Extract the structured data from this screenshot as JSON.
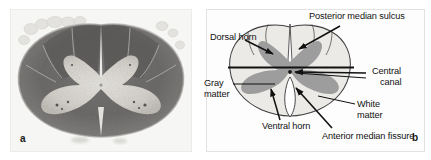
{
  "figure": {
    "type": "two-panel anatomical figure"
  },
  "panel_a": {
    "letter": "a",
    "kind": "histological-micrograph",
    "description": "Myelin-stained transverse section of spinal cord",
    "colors": {
      "white_matter": "#6e6e6e",
      "gray_matter": "#d8d6d2",
      "background": "#f4f4f2"
    }
  },
  "panel_b": {
    "letter": "b",
    "kind": "schematic-diagram",
    "colors": {
      "gray_matter": "#9a9a9a",
      "white_matter": "#e9e9e7",
      "outline": "#3a3a3a",
      "leader_line": "#111111",
      "text": "#111111"
    },
    "labels": [
      {
        "id": "posterior-median-sulcus",
        "text": "Posterior median sulcus",
        "x": 109,
        "y": 11
      },
      {
        "id": "dorsal-horn",
        "text": "Dorsal horn",
        "x": 10,
        "y": 32
      },
      {
        "id": "central-canal-line1",
        "text": "Central",
        "x": 172,
        "y": 70
      },
      {
        "id": "central-canal-line2",
        "text": "canal",
        "x": 180,
        "y": 81
      },
      {
        "id": "gray-matter-line1",
        "text": "Gray",
        "x": 4,
        "y": 81
      },
      {
        "id": "gray-matter-line2",
        "text": "matter",
        "x": 4,
        "y": 92
      },
      {
        "id": "white-matter-line1",
        "text": "White",
        "x": 157,
        "y": 102
      },
      {
        "id": "white-matter-line2",
        "text": "matter",
        "x": 157,
        "y": 113
      },
      {
        "id": "ventral-horn",
        "text": "Ventral horn",
        "x": 62,
        "y": 124
      },
      {
        "id": "anterior-median-fissure",
        "text": "Anterior median fissure",
        "x": 122,
        "y": 134
      }
    ]
  }
}
